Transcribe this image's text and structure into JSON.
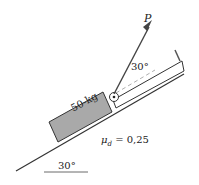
{
  "diagram": {
    "force_label": "P",
    "force_angle_label": "30°",
    "incline_angle_label": "30°",
    "block_label": "50-kg",
    "friction_label": "μd = 0,25",
    "friction_symbol": "μ",
    "friction_subscript": "d",
    "friction_value": " = 0,25",
    "colors": {
      "block_fill": "#a9a9a9",
      "line": "#333333",
      "arrow": "#444444",
      "guide": "#999999"
    }
  }
}
